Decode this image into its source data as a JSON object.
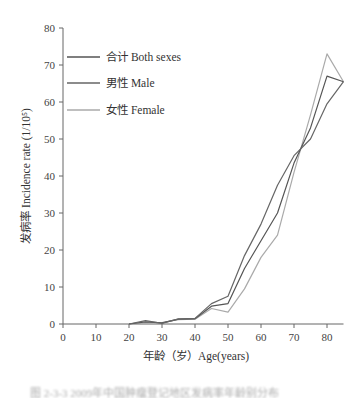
{
  "chart_data": {
    "type": "line",
    "title": "",
    "xlabel": "年龄（岁）Age(years)",
    "ylabel": "发病率 Incidence rate (1/10⁵)",
    "xlim": [
      0,
      85
    ],
    "ylim": [
      0,
      80
    ],
    "xticks": [
      0,
      10,
      20,
      30,
      40,
      50,
      60,
      70,
      80
    ],
    "yticks": [
      0,
      10,
      20,
      30,
      40,
      50,
      60,
      70,
      80
    ],
    "grid": false,
    "legend_position": "upper-left",
    "x": [
      20,
      25,
      30,
      35,
      40,
      45,
      50,
      55,
      60,
      65,
      70,
      75,
      80,
      85
    ],
    "series": [
      {
        "name": "合计 Both sexes",
        "color": "#555555",
        "values": [
          0,
          0.6,
          0.3,
          1.3,
          1.4,
          4.8,
          5.5,
          15.0,
          22.5,
          30.0,
          43.5,
          53.0,
          67.0,
          65.5
        ]
      },
      {
        "name": "男性 Male",
        "color": "#666666",
        "values": [
          0,
          0.9,
          0.2,
          1.4,
          1.5,
          5.5,
          7.5,
          18.5,
          27.0,
          37.5,
          45.5,
          50.0,
          59.5,
          65.5
        ]
      },
      {
        "name": "女性 Female",
        "color": "#aaaaaa",
        "values": [
          0,
          0.3,
          0.4,
          1.2,
          1.3,
          4.2,
          3.2,
          9.5,
          18.0,
          24.0,
          41.0,
          56.5,
          73.0,
          65.5
        ]
      }
    ]
  },
  "legend": {
    "items": [
      {
        "zh": "合计",
        "en": "Both sexes"
      },
      {
        "zh": "男性",
        "en": "Male"
      },
      {
        "zh": "女性",
        "en": "Female"
      }
    ]
  },
  "axes": {
    "x_title": "年龄（岁）Age(years)",
    "y_title": "发病率 Incidence rate (1/10⁵)"
  },
  "caption": "图 2-3-3 2009年中国肿瘤登记地区发病率年龄别分布"
}
